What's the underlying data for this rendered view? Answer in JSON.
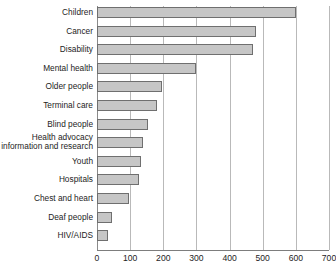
{
  "chart_data": {
    "type": "bar",
    "orientation": "horizontal",
    "title": "",
    "xlabel": "",
    "ylabel": "",
    "xlim": [
      0,
      700
    ],
    "xticks": [
      0,
      100,
      200,
      300,
      400,
      500,
      600,
      700
    ],
    "grid": true,
    "legend": false,
    "categories": [
      "Children",
      "Cancer",
      "Disability",
      "Mental health",
      "Older people",
      "Terminal care",
      "Blind people",
      "Health advocacy information and research",
      "Youth",
      "Hospitals",
      "Chest and heart",
      "Deaf people",
      "HIV/AIDS"
    ],
    "values": [
      600,
      480,
      470,
      300,
      195,
      182,
      153,
      140,
      133,
      128,
      97,
      44,
      34
    ]
  },
  "axis": {
    "tick_labels": [
      "0",
      "100",
      "200",
      "300",
      "400",
      "500",
      "600",
      "700"
    ]
  },
  "categories": [
    {
      "label": "Children",
      "value": 600,
      "two_line": false
    },
    {
      "label": "Cancer",
      "value": 480,
      "two_line": false
    },
    {
      "label": "Disability",
      "value": 470,
      "two_line": false
    },
    {
      "label": "Mental health",
      "value": 300,
      "two_line": false
    },
    {
      "label": "Older people",
      "value": 195,
      "two_line": false
    },
    {
      "label": "Terminal care",
      "value": 182,
      "two_line": false
    },
    {
      "label": "Blind people",
      "value": 153,
      "two_line": false
    },
    {
      "label": "Health advocacy information and research",
      "value": 140,
      "two_line": true
    },
    {
      "label": "Youth",
      "value": 133,
      "two_line": false
    },
    {
      "label": "Hospitals",
      "value": 128,
      "two_line": false
    },
    {
      "label": "Chest and heart",
      "value": 97,
      "two_line": false
    },
    {
      "label": "Deaf people",
      "value": 44,
      "two_line": false
    },
    {
      "label": "HIV/AIDS",
      "value": 34,
      "two_line": false
    }
  ],
  "colors": {
    "bar_fill": "#c6c6c6",
    "bar_stroke": "#6f6f6f",
    "gridline": "#b9b9b9",
    "axis": "#7d7d7d",
    "text": "#1d1d1d",
    "background": "#ffffff"
  }
}
